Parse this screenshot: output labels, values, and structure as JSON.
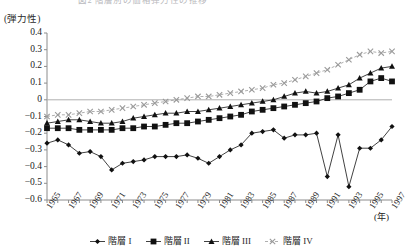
{
  "title": {
    "text": "図2 階層別の価格弾力性の推移"
  },
  "axis": {
    "y_unit_label": "(弾力性)",
    "x_unit_label": "(年)",
    "y_ticks": [
      "0.4",
      "0.3",
      "0.2",
      "0.1",
      "0",
      "-0.1",
      "-0.2",
      "-0.3",
      "-0.4",
      "-0.5",
      "-0.6"
    ],
    "x_ticks": [
      "1965",
      "1967",
      "1969",
      "1971",
      "1973",
      "1975",
      "1977",
      "1979",
      "1981",
      "1983",
      "1985",
      "1987",
      "1989",
      "1991",
      "1993",
      "1995",
      "1997"
    ]
  },
  "legend": {
    "position": "bottom",
    "items": [
      {
        "label": "階層 I",
        "marker": "diamond-marker",
        "color": "#111111"
      },
      {
        "label": "階層 II",
        "marker": "square-marker",
        "color": "#111111"
      },
      {
        "label": "階層 III",
        "marker": "triangle-marker",
        "color": "#111111"
      },
      {
        "label": "階層 IV",
        "marker": "cross-marker",
        "color": "#9a9a9a"
      }
    ]
  },
  "chart_data": {
    "type": "line",
    "title": "図2 階層別の価格弾力性の推移",
    "xlabel": "(年)",
    "ylabel": "(弾力性)",
    "ylim": [
      -0.6,
      0.4
    ],
    "xlim": [
      1965,
      1997
    ],
    "grid": false,
    "zero_line": true,
    "legend_position": "bottom",
    "x": [
      1965,
      1966,
      1967,
      1968,
      1969,
      1970,
      1971,
      1972,
      1973,
      1974,
      1975,
      1976,
      1977,
      1978,
      1979,
      1980,
      1981,
      1982,
      1983,
      1984,
      1985,
      1986,
      1987,
      1988,
      1989,
      1990,
      1991,
      1992,
      1993,
      1994,
      1995,
      1996,
      1997
    ],
    "series": [
      {
        "name": "階層 I",
        "marker": "diamond",
        "color": "#111111",
        "values": [
          -0.26,
          -0.24,
          -0.27,
          -0.32,
          -0.31,
          -0.34,
          -0.42,
          -0.38,
          -0.37,
          -0.36,
          -0.34,
          -0.34,
          -0.34,
          -0.33,
          -0.35,
          -0.38,
          -0.34,
          -0.3,
          -0.27,
          -0.2,
          -0.19,
          -0.18,
          -0.23,
          -0.21,
          -0.21,
          -0.2,
          -0.46,
          -0.21,
          -0.52,
          -0.29,
          -0.29,
          -0.24,
          -0.16
        ]
      },
      {
        "name": "階層 II",
        "marker": "square",
        "color": "#111111",
        "values": [
          -0.17,
          -0.17,
          -0.17,
          -0.18,
          -0.18,
          -0.18,
          -0.18,
          -0.17,
          -0.17,
          -0.16,
          -0.16,
          -0.15,
          -0.14,
          -0.14,
          -0.13,
          -0.12,
          -0.11,
          -0.1,
          -0.09,
          -0.07,
          -0.06,
          -0.05,
          -0.04,
          -0.03,
          -0.02,
          -0.01,
          0.01,
          0.02,
          0.04,
          0.06,
          0.11,
          0.13,
          0.11
        ]
      },
      {
        "name": "階層 III",
        "marker": "triangle",
        "color": "#111111",
        "values": [
          -0.14,
          -0.13,
          -0.12,
          -0.12,
          -0.13,
          -0.14,
          -0.14,
          -0.13,
          -0.11,
          -0.1,
          -0.09,
          -0.08,
          -0.08,
          -0.07,
          -0.07,
          -0.06,
          -0.05,
          -0.04,
          -0.03,
          -0.02,
          -0.01,
          0.0,
          0.02,
          0.04,
          0.05,
          0.04,
          0.05,
          0.07,
          0.09,
          0.13,
          0.16,
          0.19,
          0.2
        ]
      },
      {
        "name": "階層 IV",
        "marker": "cross",
        "color": "#9a9a9a",
        "values": [
          -0.1,
          -0.09,
          -0.09,
          -0.08,
          -0.07,
          -0.07,
          -0.06,
          -0.05,
          -0.04,
          -0.03,
          -0.02,
          -0.01,
          0.0,
          0.01,
          0.02,
          0.02,
          0.03,
          0.04,
          0.05,
          0.06,
          0.07,
          0.09,
          0.1,
          0.12,
          0.14,
          0.16,
          0.18,
          0.21,
          0.24,
          0.27,
          0.29,
          0.28,
          0.29
        ]
      }
    ]
  }
}
